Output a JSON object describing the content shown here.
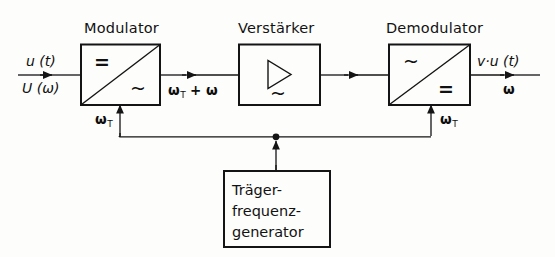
{
  "diagram": {
    "title_modulator": "Modulator",
    "title_amplifier": "Verstärker",
    "title_demodulator": "Demodulator",
    "input_top": "u (t)",
    "input_bottom": "U (ω)",
    "mid_label": "ω",
    "mid_label_sub": "T",
    "mid_label_rest": " + ω",
    "output_top": "v·u (t)",
    "output_bottom": "ω",
    "carrier_left": "ω",
    "carrier_left_sub": "T",
    "carrier_right": "ω",
    "carrier_right_sub": "T",
    "generator_lines": [
      "Träger-",
      "frequenz-",
      "generator"
    ],
    "symbol_dc": "=",
    "symbol_ac": "~",
    "colors": {
      "line": "#141414",
      "background": "#fdfdfc",
      "text": "#111111"
    }
  }
}
